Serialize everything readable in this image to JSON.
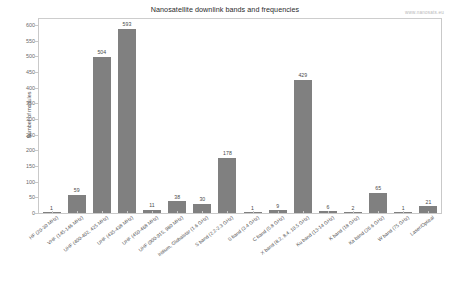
{
  "chart": {
    "title": "Nanosatellite downlink bands and frequencies",
    "watermark": "www.nanosats.eu",
    "ylabel": "Number of modules"
  },
  "chart_data": {
    "type": "bar",
    "title": "Nanosatellite downlink bands and frequencies",
    "xlabel": "",
    "ylabel": "Number of modules",
    "ylim": [
      0,
      625
    ],
    "yticks": [
      0,
      50,
      100,
      150,
      200,
      250,
      300,
      350,
      400,
      450,
      500,
      550,
      600
    ],
    "grid": false,
    "legend": null,
    "bar_color": "#808080",
    "categories": [
      "HF (20-30 MHz)",
      "VHF (145-146 MHz)",
      "UHF (400-402, 425 MHz)",
      "UHF (435-438 MHz)",
      "UHF (450-468 MHz)",
      "UHF (900-915, 980 MHz)",
      "Iridium, Globalstar (1.6 GHz)",
      "S band (2.2-2.3 GHz)",
      "S band (3.4 GHz)",
      "C band (5.8 GHz)",
      "X band (8.2, 8.4, 10.5 GHz)",
      "Ku band (13-14 GHz)",
      "K band (18 GHz)",
      "Ka band (26.6 GHz)",
      "W band (75 GHz)",
      "Laser/Optical"
    ],
    "values": [
      1,
      59,
      504,
      593,
      11,
      38,
      30,
      178,
      1,
      9,
      429,
      6,
      2,
      65,
      1,
      21
    ]
  }
}
